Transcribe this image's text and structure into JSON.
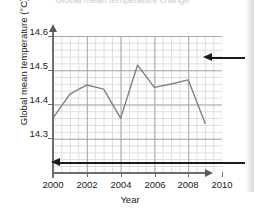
{
  "figure": {
    "cut_off_title": "Global mean temperature change",
    "background_color": "#ffffff"
  },
  "axes": {
    "y_title": "Global mean temperature (°C)",
    "x_title": "Year",
    "y_ticks": [
      "14.3",
      "14.4",
      "14.5",
      "14.6"
    ],
    "x_ticks": [
      "2000",
      "2002",
      "2004",
      "2006",
      "2008",
      "2010"
    ],
    "grid_major_color": "#a8a8a8",
    "grid_minor_color": "#dcdcdc",
    "axis_color": "#6e6e6e"
  },
  "annotations": {
    "upper_arrow_label": "",
    "lower_arrow_label": "",
    "arrow_color": "#1a1a1a"
  },
  "chart_data": {
    "type": "line",
    "title": "Global mean temperature change",
    "xlabel": "Year",
    "ylabel": "Global mean temperature (°C)",
    "xlim": [
      2000,
      2010
    ],
    "ylim": [
      14.24,
      14.64
    ],
    "xticks": [
      2000,
      2002,
      2004,
      2006,
      2008,
      2010
    ],
    "yticks": [
      14.3,
      14.4,
      14.5,
      14.6
    ],
    "grid": true,
    "legend": null,
    "line_color": "#808080",
    "x": [
      2000,
      2001,
      2002,
      2003,
      2004,
      2005,
      2006,
      2007,
      2008,
      2009
    ],
    "values": [
      14.4,
      14.47,
      14.497,
      14.485,
      14.4,
      14.555,
      14.49,
      14.5,
      14.512,
      14.385
    ],
    "series": [
      {
        "name": "Global mean temperature",
        "values": [
          14.4,
          14.47,
          14.497,
          14.485,
          14.4,
          14.555,
          14.49,
          14.5,
          14.512,
          14.385
        ]
      }
    ]
  }
}
